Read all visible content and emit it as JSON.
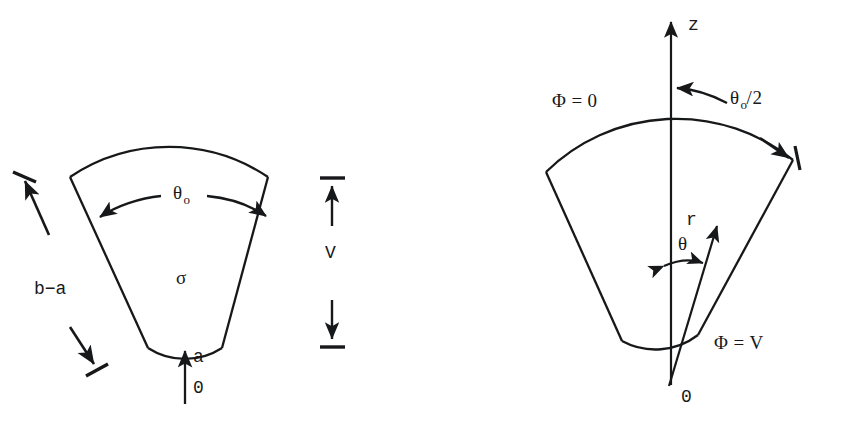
{
  "figure": {
    "stroke_color": "#17181a",
    "background_color": "#ffffff",
    "panels": [
      {
        "name": "left-panel",
        "description": "Annular sector with physical dimensions labelled",
        "labels": {
          "theta_zero": "θ",
          "theta_zero_sub": "o",
          "sigma": "σ",
          "thickness": "b−a",
          "inner_radius": "a",
          "origin": "0",
          "voltage": "V"
        }
      },
      {
        "name": "right-panel",
        "description": "Same sector in cylindrical coordinates about the z axis",
        "labels": {
          "phi_zero_symbol": "Φ",
          "phi_zero_equals": "=",
          "phi_zero_value": "0",
          "z_axis": "z",
          "half_angle": "θ",
          "half_angle_sub": "o",
          "half_angle_divisor": "/2",
          "radius_vector": "r",
          "polar_angle": "θ",
          "phi_v_symbol": "Φ",
          "phi_v_equals": "=",
          "phi_v_value": "V",
          "origin": "0"
        }
      }
    ]
  }
}
